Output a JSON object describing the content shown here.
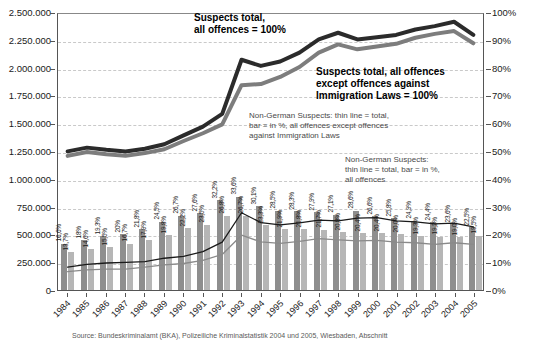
{
  "chart_data": {
    "type": "bar",
    "title": "",
    "xlabel": "",
    "ylabel": "",
    "grid": true,
    "legend_position": "inline-annotations",
    "categories": [
      "1984",
      "1985",
      "1986",
      "1987",
      "1988",
      "1989",
      "1990",
      "1991",
      "1992",
      "1993",
      "1994",
      "1995",
      "1996",
      "1997",
      "1998",
      "1999",
      "2000",
      "2001",
      "2002",
      "2003",
      "2004",
      "2005"
    ],
    "left_axis": {
      "label": "Suspects (absolute numbers)",
      "ylim": [
        0,
        2500000
      ],
      "tick_step": 250000,
      "ticks": [
        "2.500.000",
        "2.250.000",
        "2.000.000",
        "1.750.000",
        "1.500.000",
        "1.250.000",
        "1.000.000",
        "750.000",
        "500.000",
        "250.000",
        "0"
      ],
      "tick_values": [
        2500000,
        2250000,
        2000000,
        1750000,
        1500000,
        1250000,
        1000000,
        750000,
        500000,
        250000,
        0
      ]
    },
    "right_axis": {
      "label": "Share in %",
      "ylim": [
        0,
        100
      ],
      "tick_step": 10,
      "ticks": [
        "100%",
        "90%",
        "80%",
        "70%",
        "60%",
        "50%",
        "40%",
        "30%",
        "20%",
        "10%",
        "0%"
      ],
      "tick_values": [
        100,
        90,
        80,
        70,
        60,
        50,
        40,
        30,
        20,
        10,
        0
      ]
    },
    "series": [
      {
        "name": "Suspects total, all offences = 100%",
        "kind": "line",
        "axis": "left",
        "color": "#2b2b2b",
        "width": 4,
        "values": [
          1255000,
          1290000,
          1270000,
          1255000,
          1280000,
          1320000,
          1400000,
          1480000,
          1595000,
          2085000,
          2030000,
          2070000,
          2150000,
          2270000,
          2330000,
          2270000,
          2290000,
          2310000,
          2360000,
          2390000,
          2430000,
          2310000
        ]
      },
      {
        "name": "Suspects total, all offences except offences against Immigration Laws = 100%",
        "kind": "line",
        "axis": "left",
        "color": "#7d7d7d",
        "width": 4,
        "values": [
          1215000,
          1250000,
          1230000,
          1215000,
          1240000,
          1275000,
          1350000,
          1420000,
          1500000,
          1855000,
          1865000,
          1930000,
          2020000,
          2150000,
          2225000,
          2180000,
          2205000,
          2230000,
          2285000,
          2320000,
          2345000,
          2235000
        ]
      },
      {
        "name": "Non-German Suspects: thin line = total, all offences",
        "kind": "line",
        "axis": "left",
        "color": "#1a1a1a",
        "width": 1.3,
        "values": [
          208000,
          232000,
          245000,
          251000,
          256000,
          288000,
          305000,
          348000,
          434000,
          700000,
          611000,
          590000,
          609000,
          633000,
          627000,
          650000,
          655000,
          626000,
          618000,
          599000,
          605000,
          572000
        ]
      },
      {
        "name": "Non-German Suspects: thin line = total, all offences except offences against Immigration Laws",
        "kind": "line",
        "axis": "left",
        "color": "#8a8a8a",
        "width": 1.3,
        "values": [
          166000,
          183000,
          190000,
          189000,
          207000,
          228000,
          240000,
          268000,
          322000,
          496000,
          435000,
          422000,
          441000,
          466000,
          454000,
          444000,
          450000,
          434000,
          428000,
          414000,
          428000,
          414000
        ]
      },
      {
        "name": "Non-German Suspects in % — all offences",
        "kind": "bar",
        "axis": "right",
        "color": "#8e8e8e",
        "labels": [
          "16,6%",
          "18%",
          "19,3%",
          "20%",
          "21,8%",
          "24,5%",
          "26,7%",
          "27,6%",
          "32,2%",
          "33,6%",
          "30,1%",
          "28,5%",
          "28,3%",
          "27,9%",
          "27,1%",
          "28,6%",
          "26,6%",
          "25,8%",
          "24,9%",
          "24,4%",
          "23,6%",
          "22,9%",
          "22,5%"
        ],
        "values": [
          16.6,
          18.0,
          19.3,
          20.0,
          21.8,
          24.5,
          26.7,
          27.6,
          32.2,
          33.6,
          30.1,
          28.5,
          28.3,
          27.9,
          27.1,
          28.6,
          26.6,
          25.8,
          24.9,
          24.4,
          23.6,
          22.5
        ]
      },
      {
        "name": "Non-German Suspects in % — all offences except offences against Immigration Laws",
        "kind": "bar",
        "axis": "right",
        "color": "#b6b6b6",
        "values": [
          13.7,
          14.6,
          15.5,
          16.7,
          17.9,
          19.8,
          22.2,
          23.5,
          26.8,
          26.7,
          23.3,
          21.9,
          21.8,
          21.7,
          20.8,
          20.4,
          20.4,
          20.0,
          19.3,
          19.2,
          19.0,
          19.5
        ]
      }
    ],
    "bar_labels_total": [
      "16,6%",
      "18%",
      "19,3%",
      "20%",
      "21,8%",
      "24,5%",
      "26,7%",
      "27,6%",
      "32,2%",
      "33,6%",
      "30,1%",
      "28,5%",
      "28,3%",
      "27,9%",
      "27,1%",
      "28,6%",
      "26,6%",
      "25,8%",
      "24,9%",
      "24,4%",
      "23,6%",
      "22,5%"
    ],
    "bar_labels_excl": [
      "13,7%",
      "14,6%",
      "15,5%",
      "16,7%",
      "17,9%",
      "19,8%",
      "22,2%",
      "23,5%",
      "26,8%",
      "26,7%",
      "23,3%",
      "21,9%",
      "21,8%",
      "21,7%",
      "20,8%",
      "20,4%",
      "20,4%",
      "20,0%",
      "19,3%",
      "19,2%",
      "19,0%",
      "19,5%"
    ]
  },
  "annotations": {
    "a1": "Suspects total,\nall offences = 100%",
    "a2": "Suspects total, all offences\nexcept offences against\nImmigration Laws = 100%",
    "a3": "Non-German Suspects: thin line = total,\nbar = in %, all offences except offences\nagainst Immigration Laws",
    "a4": "Non-German Suspects:\nthin line = total, bar = in %,\nall offences"
  },
  "source": "Source: Bundeskriminalamt (BKA), Polizeiliche Kriminalstatistik 2004 und 2005, Wiesbaden, Abschnitt",
  "colors": {
    "line_total_all": "#2b2b2b",
    "line_total_excl": "#7d7d7d",
    "bar_total_all": "#8e8e8e",
    "bar_total_excl": "#b6b6b6",
    "grid": "#c9c9c9",
    "axis": "#555555"
  }
}
